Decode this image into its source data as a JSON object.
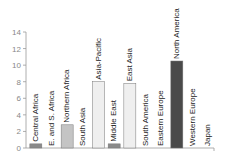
{
  "chart_data": {
    "type": "bar",
    "title": "",
    "xlabel": "",
    "ylabel": "",
    "ylim": [
      0,
      14
    ],
    "yticks": [
      0,
      2,
      4,
      6,
      8,
      10,
      12,
      14
    ],
    "grid": false,
    "legend": null,
    "categories": [
      "Central Africa",
      "E. and S. Africa",
      "Northern Africa",
      "South Asia",
      "Asia-Pacific",
      "Middle East",
      "East Asia",
      "South America",
      "Eastern Europe",
      "North America",
      "Western Europe",
      "Japan"
    ],
    "values": [
      0.5,
      0,
      2.8,
      0,
      8.0,
      0.5,
      7.8,
      0,
      0,
      10.5,
      0,
      0
    ],
    "colors": [
      "#8a8a8a",
      "#8a8a8a",
      "#c4c4c4",
      "#c4c4c4",
      "#efefef",
      "#8a8a8a",
      "#efefef",
      "#c4c4c4",
      "#c4c4c4",
      "#4a4a4a",
      "#4a4a4a",
      "#4a4a4a"
    ]
  }
}
